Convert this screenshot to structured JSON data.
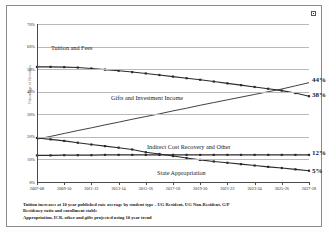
{
  "chart_data": {
    "type": "line",
    "title": "",
    "xlabel": "",
    "ylabel": "Percentage of Revenues",
    "ylim": [
      0,
      70
    ],
    "ytick_labels": [
      "70%",
      "60%",
      "50%",
      "40%",
      "30%",
      "20%",
      "10%",
      "0%"
    ],
    "ytick_values": [
      70,
      60,
      50,
      40,
      30,
      20,
      10,
      0
    ],
    "grid": true,
    "legend_position": "inline-annotations",
    "categories": [
      "2007-08",
      "2008-09",
      "2009-10",
      "2010-11",
      "2011-12",
      "2012-13",
      "2013-14",
      "2014-15",
      "2015-16",
      "2016-17",
      "2017-18",
      "2018-19",
      "2019-20",
      "2020-21",
      "2021-22",
      "2022-23",
      "2023-24",
      "2024-25",
      "2025-26",
      "2026-27",
      "2027-28"
    ],
    "xtick_labels": [
      "2007-08",
      "2009-10",
      "2011-12",
      "2013-14",
      "2015-16",
      "2017-18",
      "2019-20",
      "2021-22",
      "2023-24",
      "2025-26",
      "2027-28"
    ],
    "series": [
      {
        "name": "Tuition and Fees",
        "end_value_label": "38%",
        "values": [
          51.0,
          51.0,
          50.9,
          50.7,
          50.3,
          49.8,
          49.3,
          48.7,
          48.1,
          47.4,
          46.7,
          46.0,
          45.3,
          44.5,
          43.7,
          42.9,
          42.1,
          41.3,
          40.5,
          39.4,
          38.0
        ]
      },
      {
        "name": "Gifts and Investment Income",
        "end_value_label": "44%",
        "values": [
          19.0,
          20.2,
          21.5,
          22.8,
          24.0,
          25.3,
          26.5,
          27.8,
          29.0,
          30.2,
          31.5,
          32.7,
          34.0,
          35.2,
          36.4,
          37.6,
          38.8,
          40.0,
          41.2,
          42.6,
          44.0
        ]
      },
      {
        "name": "Indirect Cost Recovery and Other",
        "end_value_label": "12%",
        "values": [
          11.8,
          11.8,
          11.9,
          11.9,
          11.9,
          12.0,
          12.0,
          12.0,
          12.0,
          12.0,
          12.0,
          12.0,
          12.0,
          12.0,
          12.0,
          12.0,
          12.0,
          12.0,
          12.0,
          12.0,
          12.0
        ]
      },
      {
        "name": "State Appropriation",
        "end_value_label": "5%",
        "values": [
          19.5,
          18.9,
          18.2,
          17.4,
          16.6,
          15.9,
          15.2,
          14.4,
          13.2,
          12.4,
          11.5,
          10.6,
          9.8,
          9.1,
          8.5,
          7.9,
          7.3,
          6.7,
          6.2,
          5.6,
          5.0
        ]
      }
    ],
    "annotations": {
      "tuition_label": "Tuition and Fees",
      "gifts_label": "Gifts and Investment Income",
      "icr_label": "Indirect Cost Recovery and Other",
      "state_label": "State Appropriation"
    }
  },
  "footnotes": [
    "Tuition increases at 10 year published rate average by student type - UG Resident, UG Non-Resident, G/P",
    "Residency ratio and enrollment stable",
    "Appropriation, ICR, other and gifts projected using 10 year trend"
  ],
  "colors": {
    "line": "#2b2b2b",
    "grid": "#b9b9b9",
    "axis": "#4a4a4a",
    "text": "#1a1a1a"
  }
}
